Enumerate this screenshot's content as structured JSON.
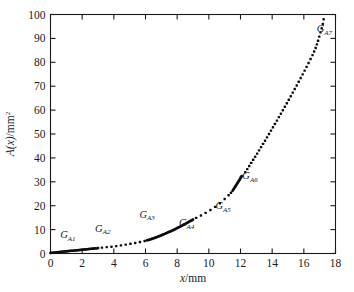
{
  "figure": {
    "background_color": "#ffffff",
    "frame_color": "#1a1a1a",
    "marker_color": "#0d0d0d"
  },
  "axes": {
    "x_title_var": "x",
    "x_title_unit": "/mm",
    "y_title_var": "A(x)",
    "y_title_unit": "/mm",
    "y_title_exp": "2",
    "x_ticks": [
      "0",
      "2",
      "4",
      "6",
      "8",
      "10",
      "12",
      "14",
      "16",
      "18"
    ],
    "y_ticks": [
      "0",
      "10",
      "20",
      "30",
      "40",
      "50",
      "60",
      "70",
      "80",
      "90",
      "100"
    ]
  },
  "annotations": [
    {
      "base": "G",
      "sub": "A1"
    },
    {
      "base": "G",
      "sub": "A2"
    },
    {
      "base": "G",
      "sub": "A3"
    },
    {
      "base": "G",
      "sub": "A4"
    },
    {
      "base": "G",
      "sub": "A5"
    },
    {
      "base": "G",
      "sub": "A6"
    },
    {
      "base": "G",
      "sub": "A7"
    }
  ],
  "chart_data": {
    "type": "scatter",
    "title": "",
    "subtitle": "",
    "xlabel": "x/mm",
    "ylabel": "A(x)/mm^2",
    "xlim": [
      0,
      18
    ],
    "ylim": [
      0,
      100
    ],
    "xtick_values": [
      0,
      2,
      4,
      6,
      8,
      10,
      12,
      14,
      16,
      18
    ],
    "ytick_values": [
      0,
      10,
      20,
      30,
      40,
      50,
      60,
      70,
      80,
      90,
      100
    ],
    "grid": false,
    "legend": "none",
    "tick_direction": "in",
    "marker_shape": "square-dot",
    "annotations": [
      {
        "label": "G_A1",
        "x": 1.1,
        "y": 6.5
      },
      {
        "label": "G_A2",
        "x": 3.3,
        "y": 9.2
      },
      {
        "label": "G_A3",
        "x": 6.1,
        "y": 15.0
      },
      {
        "label": "G_A4",
        "x": 8.6,
        "y": 11.5
      },
      {
        "label": "G_A5",
        "x": 10.9,
        "y": 18.5
      },
      {
        "label": "G_A6",
        "x": 12.6,
        "y": 31.0
      },
      {
        "label": "G_A7",
        "x": 17.3,
        "y": 92.5
      }
    ],
    "segments": [
      {
        "name": "G_A1",
        "style": "solid-dense",
        "x_range": [
          0.0,
          3.0
        ],
        "points": [
          [
            0.0,
            0.25
          ],
          [
            0.15,
            0.35
          ],
          [
            0.3,
            0.45
          ],
          [
            0.45,
            0.55
          ],
          [
            0.6,
            0.65
          ],
          [
            0.75,
            0.75
          ],
          [
            0.9,
            0.85
          ],
          [
            1.05,
            0.95
          ],
          [
            1.2,
            1.05
          ],
          [
            1.35,
            1.15
          ],
          [
            1.5,
            1.25
          ],
          [
            1.65,
            1.35
          ],
          [
            1.8,
            1.45
          ],
          [
            1.95,
            1.55
          ],
          [
            2.1,
            1.65
          ],
          [
            2.25,
            1.75
          ],
          [
            2.4,
            1.85
          ],
          [
            2.55,
            1.95
          ],
          [
            2.7,
            2.05
          ],
          [
            2.85,
            2.15
          ],
          [
            3.0,
            2.25
          ]
        ]
      },
      {
        "name": "G_A2",
        "style": "dotted-spaced",
        "x_range": [
          3.2,
          6.0
        ],
        "points": [
          [
            3.25,
            2.45
          ],
          [
            3.55,
            2.65
          ],
          [
            3.85,
            2.85
          ],
          [
            4.15,
            3.1
          ],
          [
            4.45,
            3.4
          ],
          [
            4.75,
            3.7
          ],
          [
            5.05,
            4.05
          ],
          [
            5.35,
            4.4
          ],
          [
            5.65,
            4.8
          ],
          [
            5.95,
            5.25
          ]
        ]
      },
      {
        "name": "G_A3",
        "style": "solid-dense",
        "x_range": [
          6.1,
          9.0
        ],
        "points": [
          [
            6.1,
            5.5
          ],
          [
            6.3,
            5.9
          ],
          [
            6.5,
            6.35
          ],
          [
            6.7,
            6.85
          ],
          [
            6.9,
            7.35
          ],
          [
            7.1,
            7.9
          ],
          [
            7.3,
            8.45
          ],
          [
            7.5,
            9.05
          ],
          [
            7.7,
            9.65
          ],
          [
            7.9,
            10.3
          ],
          [
            8.1,
            10.95
          ],
          [
            8.3,
            11.65
          ],
          [
            8.5,
            12.35
          ],
          [
            8.7,
            13.1
          ],
          [
            8.9,
            13.85
          ],
          [
            9.0,
            14.2
          ]
        ]
      },
      {
        "name": "G_A4",
        "style": "dotted-spaced",
        "x_range": [
          9.2,
          11.3
        ],
        "points": [
          [
            9.2,
            14.9
          ],
          [
            9.5,
            15.9
          ],
          [
            9.8,
            17.0
          ],
          [
            10.1,
            18.2
          ],
          [
            10.4,
            19.5
          ],
          [
            10.7,
            21.0
          ],
          [
            11.0,
            22.8
          ],
          [
            11.25,
            24.4
          ]
        ]
      },
      {
        "name": "G_A5",
        "style": "dotted-spaced",
        "x_range": [
          11.3,
          11.5
        ],
        "points": [
          [
            11.4,
            25.4
          ]
        ]
      },
      {
        "name": "G_A6",
        "style": "solid-dense",
        "x_range": [
          11.5,
          12.1
        ],
        "points": [
          [
            11.5,
            26.3
          ],
          [
            11.62,
            27.5
          ],
          [
            11.74,
            28.7
          ],
          [
            11.86,
            30.0
          ],
          [
            11.98,
            31.3
          ],
          [
            12.08,
            32.4
          ]
        ]
      },
      {
        "name": "G_A7",
        "style": "dotted-spaced",
        "x_range": [
          12.2,
          17.2
        ],
        "points": [
          [
            12.3,
            34.0
          ],
          [
            12.55,
            36.6
          ],
          [
            12.8,
            39.2
          ],
          [
            13.05,
            41.8
          ],
          [
            13.3,
            44.5
          ],
          [
            13.55,
            47.2
          ],
          [
            13.8,
            50.0
          ],
          [
            14.05,
            52.8
          ],
          [
            14.3,
            55.6
          ],
          [
            14.55,
            58.5
          ],
          [
            14.8,
            61.4
          ],
          [
            15.05,
            64.3
          ],
          [
            15.3,
            67.3
          ],
          [
            15.55,
            70.3
          ],
          [
            15.8,
            73.4
          ],
          [
            16.05,
            76.5
          ],
          [
            16.3,
            79.7
          ],
          [
            16.55,
            83.0
          ],
          [
            16.75,
            86.0
          ],
          [
            16.9,
            89.0
          ],
          [
            17.05,
            92.5
          ],
          [
            17.2,
            96.0
          ],
          [
            17.25,
            98.0
          ]
        ]
      }
    ]
  }
}
